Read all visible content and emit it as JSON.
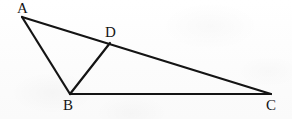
{
  "figure": {
    "kind": "geometry-diagram",
    "width": 292,
    "height": 119,
    "background_color": "#fdfdfd",
    "stroke_color": "#141414",
    "stroke_width": 2.2,
    "label_color": "#141414",
    "points": [
      {
        "id": "A",
        "label": "A",
        "x": 22,
        "y": 17,
        "label_x": 17,
        "label_y": 1
      },
      {
        "id": "B",
        "label": "B",
        "x": 70,
        "y": 94,
        "label_x": 63,
        "label_y": 98
      },
      {
        "id": "C",
        "label": "C",
        "x": 271,
        "y": 94,
        "label_x": 266,
        "label_y": 98
      },
      {
        "id": "D",
        "label": "D",
        "x": 110,
        "y": 43,
        "label_x": 105,
        "label_y": 25
      }
    ],
    "segments": [
      {
        "id": "AC",
        "from": "A",
        "to": "C",
        "name": "segment-ac"
      },
      {
        "id": "AB",
        "from": "A",
        "to": "B",
        "name": "segment-ab"
      },
      {
        "id": "BC",
        "from": "B",
        "to": "C",
        "name": "segment-bc"
      },
      {
        "id": "BD",
        "from": "B",
        "to": "D",
        "name": "segment-bd"
      }
    ]
  }
}
